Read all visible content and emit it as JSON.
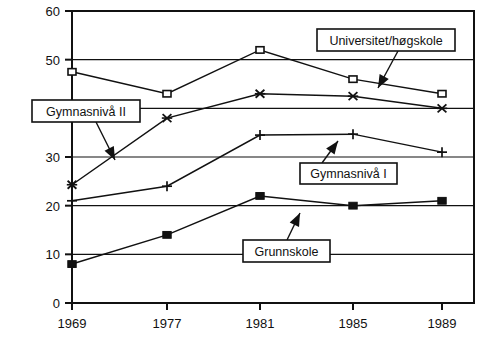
{
  "chart_data": {
    "type": "line",
    "title": "",
    "xlabel": "",
    "ylabel": "",
    "categories": [
      "1969",
      "1977",
      "1981",
      "1985",
      "1989"
    ],
    "x_tick_labels": [
      "1969",
      "1977",
      "1981",
      "1985",
      "1989"
    ],
    "y_tick_labels": [
      "0",
      "10",
      "20",
      "30",
      "40",
      "50",
      "60"
    ],
    "y_ticks": [
      0,
      10,
      20,
      30,
      40,
      50,
      60
    ],
    "ylim": [
      0,
      60
    ],
    "grid": "horizontal",
    "legend_position": "inline-callout-boxes",
    "series": [
      {
        "name": "Universitet/høgskole",
        "marker": "open-square",
        "values": [
          47.5,
          43,
          52,
          46,
          43
        ]
      },
      {
        "name": "Gymnasnivå II",
        "marker": "cross-x",
        "values": [
          24.3,
          38,
          43,
          42.5,
          40
        ]
      },
      {
        "name": "Gymnasnivå I",
        "marker": "plus",
        "values": [
          21,
          24,
          34.5,
          34.7,
          31
        ]
      },
      {
        "name": "Grunnskole",
        "marker": "filled-square",
        "values": [
          8,
          14,
          22,
          20,
          21
        ]
      }
    ],
    "annotations": [
      {
        "label": "Universitet/høgskole",
        "points_to_series": "Universitet/høgskole"
      },
      {
        "label": "Gymnasnivå II",
        "points_to_series": "Gymnasnivå II"
      },
      {
        "label": "Gymnasnivå I",
        "points_to_series": "Gymnasnivå I"
      },
      {
        "label": "Grunnskole",
        "points_to_series": "Grunnskole"
      }
    ]
  }
}
